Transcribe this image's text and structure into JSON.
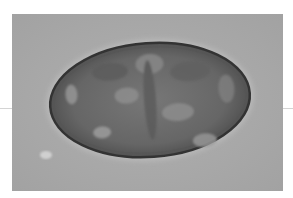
{
  "image": {
    "subject": "microscopic oval egg",
    "colors": {
      "background": "#ffffff",
      "field": "#a9a9a9",
      "egg_shell": "#3c3c3c",
      "egg_body": "#6e6e6e",
      "highlight": "#c8c8c8"
    }
  }
}
